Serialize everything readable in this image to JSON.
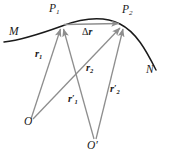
{
  "figure": {
    "width": 170,
    "height": 164,
    "background": "#ffffff"
  },
  "colors": {
    "trajectory": "#1a1a1a",
    "vector": "#8e8e8e",
    "displacement": "#8e8e8e",
    "label_text": "#1a1a1a"
  },
  "labels": {
    "curve_start": "M",
    "curve_end": "N",
    "point_1": "P",
    "point_1_sub": "1",
    "point_2": "P",
    "point_2_sub": "2",
    "origin_1": "O",
    "origin_2": "O",
    "origin_2_prime": "′",
    "vector_r1": "r",
    "vector_r1_sub": "1",
    "vector_r2": "r",
    "vector_r2_sub": "2",
    "vector_r1_prime": "r",
    "vector_r1_prime_sub": "1",
    "vector_r1_prime_mark": "′",
    "vector_r2_prime": "r",
    "vector_r2_prime_sub": "2",
    "vector_r2_prime_mark": "′",
    "displacement_delta": "Δ",
    "displacement_r": "r"
  },
  "geometry": {
    "point_P1": {
      "x": 62,
      "y": 26
    },
    "point_P2": {
      "x": 122,
      "y": 24
    },
    "origin_O": {
      "x": 31,
      "y": 121
    },
    "origin_Oprime": {
      "x": 95,
      "y": 142
    },
    "trajectory_path": "M 4,42 C 22,40 40,34 62,26 C 86,17 104,16 120,24 C 136,32 146,50 156,70",
    "vectors": [
      {
        "name": "r1",
        "from": "O",
        "to": "P1"
      },
      {
        "name": "r2",
        "from": "O",
        "to": "P2"
      },
      {
        "name": "r1prime",
        "from": "Oprime",
        "to": "P1"
      },
      {
        "name": "r2prime",
        "from": "Oprime",
        "to": "P2"
      },
      {
        "name": "delta_r",
        "from": "P1",
        "to": "P2"
      }
    ]
  }
}
